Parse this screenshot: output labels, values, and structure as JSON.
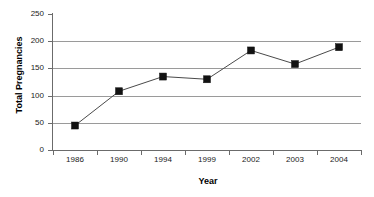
{
  "chart_data": {
    "type": "line",
    "title": "",
    "xlabel": "Year",
    "ylabel": "Total Pregnancies",
    "categories": [
      "1986",
      "1990",
      "1994",
      "1999",
      "2002",
      "2003",
      "2004"
    ],
    "values": [
      45,
      108,
      135,
      130,
      183,
      158,
      189
    ],
    "series": [
      {
        "name": "Total Pregnancies",
        "values": [
          45,
          108,
          135,
          130,
          183,
          158,
          189
        ]
      }
    ],
    "ylim": [
      0,
      250
    ],
    "yticks": [
      "0",
      "50",
      "100",
      "150",
      "200",
      "250"
    ],
    "ytick_values": [
      0,
      50,
      100,
      150,
      200,
      250
    ],
    "grid": true,
    "grid_axis": "y",
    "legend": false,
    "marker": "square",
    "marker_color": "#121212",
    "line_color": "#4a4a4a",
    "gridline_color": "#9a9a9a",
    "axis_color": "#6b6b6b",
    "background_color": "#ffffff"
  },
  "axis": {
    "y_title": "Total Pregnancies",
    "x_title": "Year"
  }
}
